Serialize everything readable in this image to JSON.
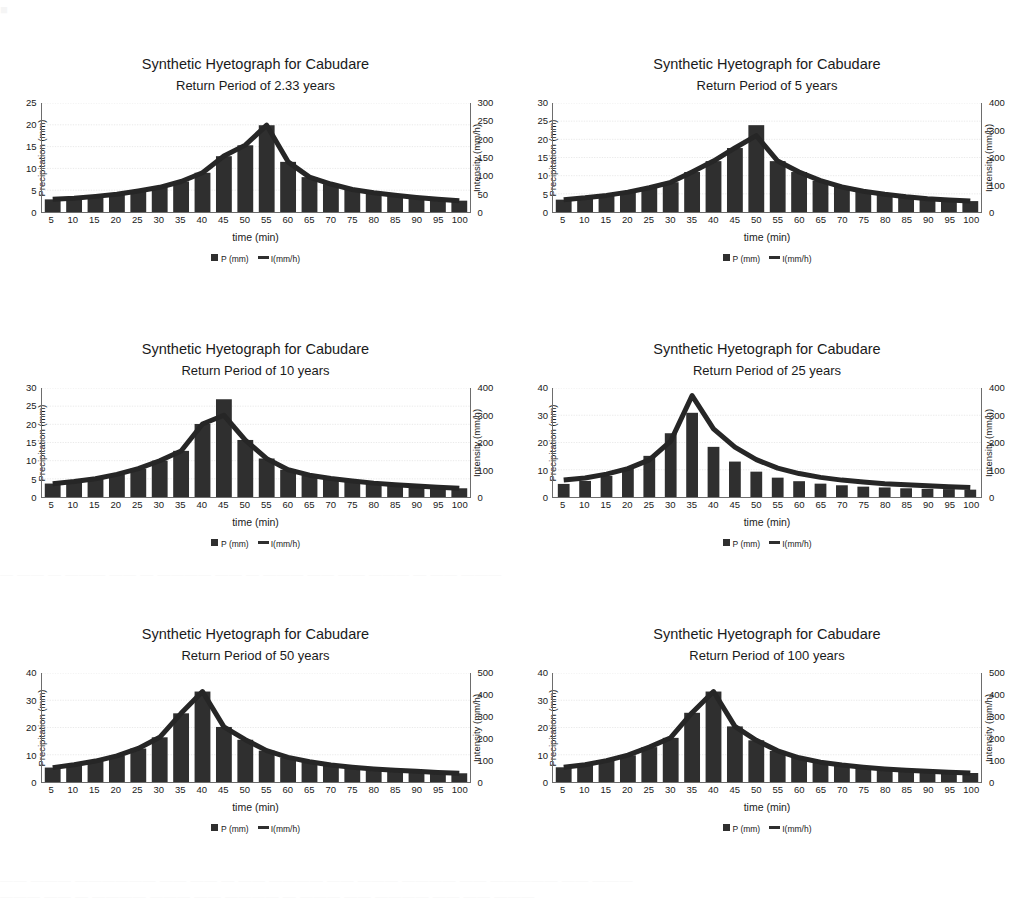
{
  "page": {
    "bleed_top": "■",
    "bleed_mid": "—  ——  — ———  —— —  ———— ——  — ———  ——  —— ———  — ——  ———",
    "bleed_bottom1": "—— ——— —————— —— —— — —— ———— —— ——— ———— —— ————— —— ———",
    "bleed_bottom2": "——— —— — ———— ——— —— ———— — ——— —— ———— —— —— ———"
  },
  "common": {
    "title": "Synthetic Hyetograph for Cabudare",
    "xlabel": "time (min)",
    "ylabel_left": "Precipitation (mm)",
    "ylabel_right": "Intensity (mm/h)",
    "legend_bar": "P (mm)",
    "legend_line": "I(mm/h)",
    "bar_color": "#2f2f2f",
    "line_color": "#262626",
    "grid_color": "#c9c9c9",
    "axis_color": "#6d6d6d",
    "categories": [
      5,
      10,
      15,
      20,
      25,
      30,
      35,
      40,
      45,
      50,
      55,
      60,
      65,
      70,
      75,
      80,
      85,
      90,
      95,
      100
    ]
  },
  "chart_data": [
    {
      "id": "hyetograph-2-33",
      "type": "bar",
      "title": "Synthetic Hyetograph for Cabudare",
      "subtitle": "Return Period of 2.33 years",
      "xlabel": "time (min)",
      "ylabel": "Precipitation (mm)",
      "ylabel_secondary": "Intensity (mm/h)",
      "categories": [
        5,
        10,
        15,
        20,
        25,
        30,
        35,
        40,
        45,
        50,
        55,
        60,
        65,
        70,
        75,
        80,
        85,
        90,
        95,
        100
      ],
      "yticks_left": [
        0,
        5,
        10,
        15,
        20,
        25
      ],
      "yticks_right": [
        0,
        50,
        100,
        150,
        200,
        250,
        300
      ],
      "ylim": [
        0,
        25
      ],
      "ylim_secondary": [
        0,
        300
      ],
      "bar_gap": "narrow",
      "grid": true,
      "legend": "bottom",
      "series": [
        {
          "name": "P (mm)",
          "kind": "bar",
          "values": [
            2.9,
            3.2,
            3.6,
            4.1,
            4.8,
            5.7,
            7.0,
            9.0,
            12.8,
            15.3,
            19.9,
            11.5,
            8.0,
            6.4,
            5.2,
            4.4,
            3.8,
            3.3,
            2.9,
            2.6
          ]
        },
        {
          "name": "I(mm/h)",
          "kind": "line",
          "values": [
            35,
            38,
            43,
            49,
            58,
            68,
            84,
            108,
            154,
            184,
            239,
            138,
            96,
            77,
            62,
            53,
            46,
            40,
            35,
            31
          ]
        }
      ]
    },
    {
      "id": "hyetograph-5",
      "type": "bar",
      "title": "Synthetic Hyetograph for Cabudare",
      "subtitle": "Return Period of 5 years",
      "xlabel": "time (min)",
      "ylabel": "Precipitation (mm)",
      "ylabel_secondary": "Intensity (mm/h)",
      "categories": [
        5,
        10,
        15,
        20,
        25,
        30,
        35,
        40,
        45,
        50,
        55,
        60,
        65,
        70,
        75,
        80,
        85,
        90,
        95,
        100
      ],
      "yticks_left": [
        0,
        5,
        10,
        15,
        20,
        25,
        30
      ],
      "yticks_right": [
        0,
        100,
        200,
        300,
        400
      ],
      "ylim": [
        0,
        30
      ],
      "ylim_secondary": [
        0,
        400
      ],
      "bar_gap": "narrow",
      "grid": true,
      "legend": "bottom",
      "series": [
        {
          "name": "P (mm)",
          "kind": "bar",
          "values": [
            3.4,
            3.9,
            4.6,
            5.5,
            6.7,
            8.2,
            11.0,
            14.0,
            17.6,
            23.9,
            14.0,
            11.0,
            8.6,
            6.9,
            5.7,
            4.9,
            4.2,
            3.7,
            3.3,
            3.0
          ]
        },
        {
          "name": "I(mm/h)",
          "kind": "line",
          "values": [
            45,
            52,
            61,
            73,
            89,
            109,
            147,
            187,
            235,
            280,
            187,
            147,
            115,
            92,
            76,
            65,
            56,
            49,
            44,
            40
          ]
        }
      ]
    },
    {
      "id": "hyetograph-10",
      "type": "bar",
      "title": "Synthetic Hyetograph for Cabudare",
      "subtitle": "Return Period of 10 years",
      "xlabel": "time (min)",
      "ylabel": "Precipitation (mm)",
      "ylabel_secondary": "Intensity (mm/h)",
      "categories": [
        5,
        10,
        15,
        20,
        25,
        30,
        35,
        40,
        45,
        50,
        55,
        60,
        65,
        70,
        75,
        80,
        85,
        90,
        95,
        100
      ],
      "yticks_left": [
        0,
        5,
        10,
        15,
        20,
        25,
        30
      ],
      "yticks_right": [
        0,
        100,
        200,
        300,
        400
      ],
      "ylim": [
        0,
        30
      ],
      "ylim_secondary": [
        0,
        400
      ],
      "bar_gap": "narrow",
      "grid": true,
      "legend": "bottom",
      "series": [
        {
          "name": "P (mm)",
          "kind": "bar",
          "values": [
            3.7,
            4.3,
            5.0,
            6.2,
            7.8,
            10.0,
            12.7,
            20.1,
            26.9,
            15.7,
            10.6,
            7.5,
            6.0,
            5.1,
            4.4,
            3.8,
            3.4,
            3.0,
            2.7,
            2.4
          ]
        },
        {
          "name": "I(mm/h)",
          "kind": "line",
          "values": [
            49,
            57,
            67,
            83,
            104,
            133,
            169,
            268,
            300,
            209,
            141,
            100,
            80,
            68,
            59,
            51,
            45,
            40,
            36,
            32
          ]
        }
      ]
    },
    {
      "id": "hyetograph-25",
      "type": "bar",
      "title": "Synthetic Hyetograph for Cabudare",
      "subtitle": "Return Period of 25 years",
      "xlabel": "time (min)",
      "ylabel": "Precipitation (mm)",
      "ylabel_secondary": "Intensity (mm/h)",
      "categories": [
        5,
        10,
        15,
        20,
        25,
        30,
        35,
        40,
        45,
        50,
        55,
        60,
        65,
        70,
        75,
        80,
        85,
        90,
        95,
        100
      ],
      "yticks_left": [
        0,
        10,
        20,
        30,
        40
      ],
      "yticks_right": [
        0,
        100,
        200,
        300,
        400
      ],
      "ylim": [
        0,
        40
      ],
      "ylim_secondary": [
        0,
        400
      ],
      "bar_gap": "wide",
      "grid": true,
      "legend": "bottom",
      "series": [
        {
          "name": "P (mm)",
          "kind": "bar",
          "values": [
            4.8,
            5.9,
            7.7,
            10.6,
            15.1,
            23.4,
            30.9,
            18.4,
            13.0,
            9.3,
            7.1,
            5.8,
            4.9,
            4.3,
            3.8,
            3.5,
            3.2,
            3.0,
            2.9,
            2.7
          ]
        },
        {
          "name": "I(mm/h)",
          "kind": "line",
          "values": [
            62,
            70,
            84,
            104,
            136,
            205,
            372,
            250,
            183,
            137,
            106,
            86,
            72,
            62,
            55,
            49,
            45,
            41,
            38,
            35
          ]
        }
      ]
    },
    {
      "id": "hyetograph-50",
      "type": "bar",
      "title": "Synthetic Hyetograph for Cabudare",
      "subtitle": "Return Period of 50 years",
      "xlabel": "time (min)",
      "ylabel": "Precipitation (mm)",
      "ylabel_secondary": "Intensity (mm/h)",
      "categories": [
        5,
        10,
        15,
        20,
        25,
        30,
        35,
        40,
        45,
        50,
        55,
        60,
        65,
        70,
        75,
        80,
        85,
        90,
        95,
        100
      ],
      "yticks_left": [
        0,
        10,
        20,
        30,
        40
      ],
      "yticks_right": [
        0,
        100,
        200,
        300,
        400,
        500
      ],
      "ylim": [
        0,
        40
      ],
      "ylim_secondary": [
        0,
        500
      ],
      "bar_gap": "narrow",
      "grid": true,
      "legend": "bottom",
      "series": [
        {
          "name": "P (mm)",
          "kind": "bar",
          "values": [
            5.3,
            6.3,
            7.7,
            9.6,
            12.3,
            16.4,
            25.2,
            33.2,
            20.2,
            15.5,
            11.5,
            9.0,
            7.4,
            6.2,
            5.4,
            4.8,
            4.3,
            3.9,
            3.5,
            3.2
          ]
        },
        {
          "name": "I(mm/h)",
          "kind": "line",
          "values": [
            66,
            79,
            96,
            120,
            154,
            205,
            315,
            415,
            253,
            194,
            144,
            113,
            93,
            78,
            68,
            60,
            54,
            49,
            44,
            40
          ]
        }
      ]
    },
    {
      "id": "hyetograph-100",
      "type": "bar",
      "title": "Synthetic Hyetograph for Cabudare",
      "subtitle": "Return Period of 100 years",
      "xlabel": "time (min)",
      "ylabel": "Precipitation (mm)",
      "ylabel_secondary": "Intensity (mm/h)",
      "categories": [
        5,
        10,
        15,
        20,
        25,
        30,
        35,
        40,
        45,
        50,
        55,
        60,
        65,
        70,
        75,
        80,
        85,
        90,
        95,
        100
      ],
      "yticks_left": [
        0,
        10,
        20,
        30,
        40
      ],
      "yticks_right": [
        0,
        100,
        200,
        300,
        400,
        500
      ],
      "ylim": [
        0,
        40
      ],
      "ylim_secondary": [
        0,
        500
      ],
      "bar_gap": "narrow",
      "grid": true,
      "legend": "bottom",
      "series": [
        {
          "name": "P (mm)",
          "kind": "bar",
          "values": [
            5.4,
            6.3,
            7.8,
            9.8,
            12.8,
            16.2,
            25.4,
            33.2,
            20.4,
            15.3,
            11.4,
            8.9,
            7.3,
            6.2,
            5.4,
            4.8,
            4.3,
            3.9,
            3.6,
            3.3
          ]
        },
        {
          "name": "I(mm/h)",
          "kind": "line",
          "values": [
            68,
            79,
            98,
            123,
            160,
            203,
            318,
            415,
            255,
            191,
            143,
            111,
            91,
            78,
            68,
            60,
            54,
            49,
            45,
            41
          ]
        }
      ]
    }
  ]
}
